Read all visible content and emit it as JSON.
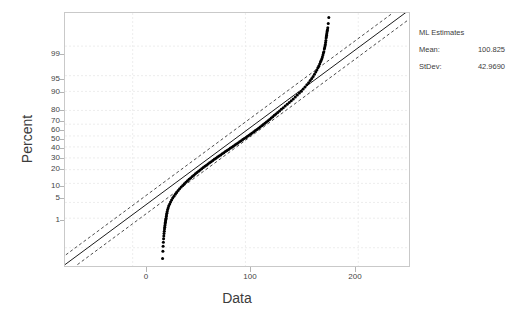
{
  "chart_data": {
    "type": "scatter",
    "plot_kind": "normal-probability-plot",
    "title": "",
    "xlabel": "Data",
    "ylabel": "Percent",
    "xlim": [
      -60,
      245
    ],
    "ylim_percent": [
      0.3,
      99.9
    ],
    "xticks": [
      0,
      100,
      200
    ],
    "xtick_labels": [
      "0",
      "100",
      "200"
    ],
    "yticks_percent": [
      1,
      5,
      10,
      20,
      30,
      40,
      50,
      60,
      70,
      80,
      90,
      95,
      99
    ],
    "ytick_labels": [
      "1",
      "5",
      "10",
      "20",
      "30",
      "40",
      "50",
      "60",
      "70",
      "80",
      "90",
      "95",
      "99"
    ],
    "grid": true,
    "grid_style": "dashed",
    "grid_color": "#e8e8e8",
    "point_color": "#000000",
    "point_marker": "filled-circle",
    "fit_line_color": "#000000",
    "ci_band_style": "dashed",
    "series": [
      {
        "name": "Data points",
        "x": [
          26.5,
          26.8,
          27.0,
          27.2,
          27.4,
          27.6,
          27.8,
          28.0,
          28.2,
          28.4,
          28.6,
          28.8,
          29.0,
          29.2,
          29.4,
          29.6,
          29.8,
          30.0,
          30.3,
          30.6,
          31.0,
          31.5,
          32.0,
          32.8,
          33.6,
          34.5,
          35.5,
          36.6,
          37.8,
          39.0,
          40.3,
          41.6,
          43.0,
          44.4,
          45.8,
          47.2,
          48.6,
          50.0,
          51.4,
          52.8,
          54.2,
          55.6,
          57.0,
          58.4,
          59.8,
          61.2,
          62.6,
          64.0,
          65.4,
          66.8,
          68.2,
          69.6,
          71.0,
          72.4,
          73.8,
          75.2,
          76.6,
          78.0,
          79.4,
          80.8,
          82.2,
          83.6,
          85.0,
          86.4,
          87.8,
          89.2,
          90.6,
          92.0,
          93.4,
          94.8,
          96.2,
          97.6,
          99.0,
          100.4,
          101.8,
          103.2,
          104.6,
          106.0,
          107.4,
          108.8,
          110.2,
          111.6,
          113.0,
          114.4,
          115.8,
          117.2,
          118.6,
          120.0,
          121.4,
          122.8,
          124.2,
          125.6,
          127.0,
          128.6,
          130.2,
          131.8,
          133.5,
          135.2,
          137.0,
          138.8,
          140.6,
          142.4,
          144.2,
          146.0,
          147.8,
          149.6,
          151.2,
          152.8,
          154.4,
          156.0,
          157.4,
          158.8,
          160.0,
          161.2,
          162.3,
          163.3,
          164.2,
          165.0,
          165.8,
          166.5,
          167.1,
          167.7,
          168.2,
          168.7,
          169.1,
          169.5,
          169.9,
          170.2,
          170.5,
          170.8,
          171.0,
          171.3,
          171.5,
          171.7,
          171.9,
          172.1,
          172.3,
          172.5,
          172.7,
          173.0,
          173.4,
          173.9
        ],
        "percent": [
          0.5,
          0.8,
          1.1,
          1.4,
          1.7,
          2.0,
          2.3,
          2.6,
          2.9,
          3.2,
          3.5,
          3.8,
          4.1,
          4.4,
          4.7,
          5.0,
          5.4,
          5.8,
          6.3,
          6.8,
          7.4,
          8.0,
          8.7,
          9.4,
          10.2,
          11.0,
          11.9,
          12.8,
          13.7,
          14.7,
          15.7,
          16.7,
          17.7,
          18.7,
          19.7,
          20.7,
          21.7,
          22.7,
          23.7,
          24.7,
          25.7,
          26.7,
          27.7,
          28.7,
          29.7,
          30.7,
          31.7,
          32.7,
          33.7,
          34.7,
          35.7,
          36.7,
          37.7,
          38.7,
          39.7,
          40.7,
          41.7,
          42.7,
          43.7,
          44.7,
          45.7,
          46.7,
          47.7,
          48.7,
          49.7,
          50.7,
          51.7,
          52.7,
          53.7,
          54.7,
          55.7,
          56.7,
          57.7,
          58.7,
          59.7,
          60.7,
          61.7,
          62.7,
          63.7,
          64.7,
          65.7,
          66.7,
          67.7,
          68.7,
          69.7,
          70.7,
          71.7,
          72.7,
          73.7,
          74.7,
          75.7,
          76.7,
          77.7,
          78.7,
          79.7,
          80.7,
          81.7,
          82.7,
          83.7,
          84.7,
          85.7,
          86.6,
          87.5,
          88.4,
          89.3,
          90.1,
          90.9,
          91.7,
          92.4,
          93.1,
          93.7,
          94.3,
          94.8,
          95.3,
          95.8,
          96.2,
          96.6,
          96.9,
          97.2,
          97.5,
          97.7,
          97.9,
          98.1,
          98.3,
          98.5,
          98.6,
          98.8,
          98.9,
          99.0,
          99.1,
          99.2,
          99.3,
          99.4,
          99.45,
          99.5,
          99.55,
          99.6,
          99.63,
          99.66,
          99.7,
          99.78,
          99.86
        ]
      }
    ],
    "fit_line": {
      "name": "Fitted normal line",
      "x0": -60,
      "p0": 0.33,
      "x1": 245,
      "p1": 99.92
    },
    "confidence_bands": [
      {
        "name": "upper-ci",
        "offset_x": -11
      },
      {
        "name": "lower-ci",
        "offset_x": 11
      }
    ],
    "annotations": {
      "ml_estimates_title": "ML Estimates",
      "mean_label": "Mean:",
      "mean_value": "100.825",
      "stdev_label": "StDev:",
      "stdev_value": "42.9690"
    }
  },
  "axes": {
    "y_title": "Percent",
    "x_title": "Data",
    "y_tick_labels": [
      "99",
      "95",
      "90",
      "80",
      "70",
      "60",
      "50",
      "40",
      "30",
      "20",
      "10",
      "5",
      "1"
    ],
    "x_tick_labels": [
      "0",
      "100",
      "200"
    ]
  },
  "ml_estimates": {
    "title": "ML Estimates",
    "rows": [
      {
        "label": "Mean:",
        "value": "100.825"
      },
      {
        "label": "StDev:",
        "value": "42.9690"
      }
    ]
  }
}
